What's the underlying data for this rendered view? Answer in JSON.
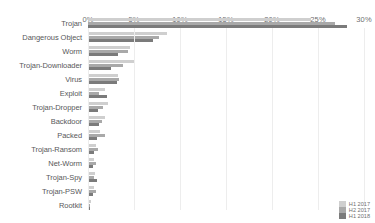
{
  "chart_data": {
    "type": "bar",
    "orientation": "horizontal",
    "title": "",
    "xlabel": "",
    "ylabel": "",
    "xlim": [
      0,
      30
    ],
    "grid": true,
    "legend_position": "bottom-right",
    "xticks": [
      "0%",
      "5%",
      "10%",
      "15%",
      "20%",
      "25%",
      "30%"
    ],
    "xtick_values": [
      0,
      5,
      10,
      15,
      20,
      25,
      30
    ],
    "categories": [
      "Trojan",
      "Dangerous Object",
      "Worm",
      "Trojan-Downloader",
      "Virus",
      "Exploit",
      "Trojan-Dropper",
      "Backdoor",
      "Packed",
      "Trojan-Ransom",
      "Net-Worm",
      "Trojan-Spy",
      "Trojan-PSW",
      "Rootkit"
    ],
    "series": [
      {
        "name": "H1 2017",
        "color": "#cfcfcf",
        "values": [
          24.2,
          8.6,
          4.6,
          5.0,
          3.3,
          1.8,
          2.2,
          1.9,
          1.3,
          0.9,
          0.7,
          0.8,
          0.7,
          0.3
        ]
      },
      {
        "name": "H2 2017",
        "color": "#a9a9a9",
        "values": [
          26.8,
          7.7,
          4.3,
          3.8,
          3.4,
          1.2,
          1.6,
          1.5,
          1.8,
          1.1,
          0.9,
          0.6,
          0.9,
          0.2
        ]
      },
      {
        "name": "H1 2018",
        "color": "#7b7b7b",
        "values": [
          28.2,
          7.1,
          3.3,
          2.5,
          3.1,
          2.1,
          1.1,
          1.2,
          1.0,
          0.6,
          0.5,
          1.0,
          0.5,
          0.2
        ]
      }
    ]
  }
}
